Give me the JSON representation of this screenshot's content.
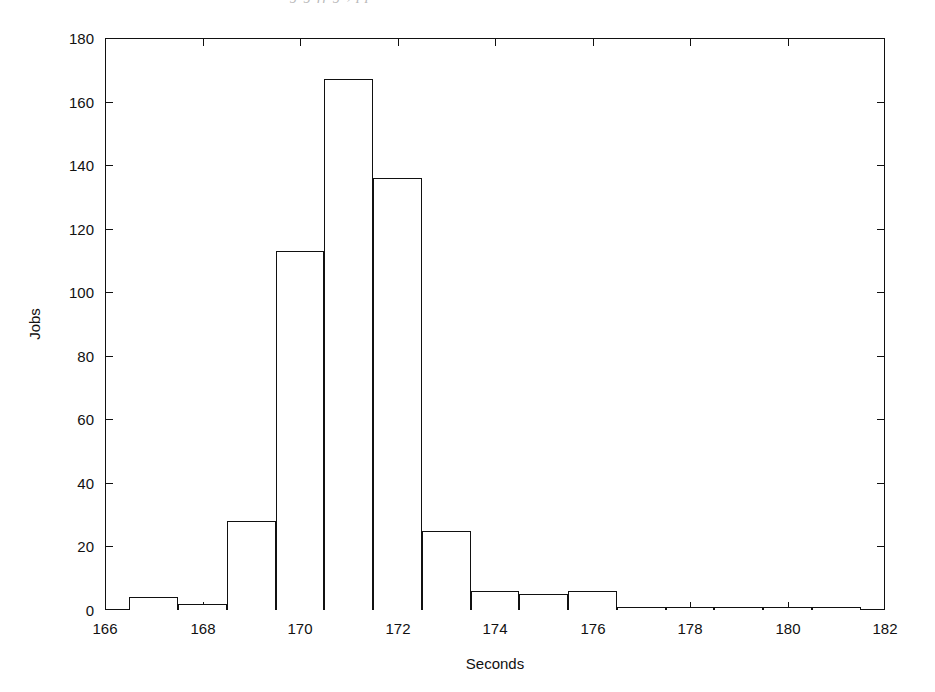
{
  "page": {
    "bleed_text": "g    g            ff  g     ,        pp",
    "background": "#ffffff",
    "ink_color": "#111111"
  },
  "chart_data": {
    "type": "bar",
    "subtype": "histogram",
    "title": "",
    "xlabel": "Seconds",
    "ylabel": "Jobs",
    "xlim": [
      166,
      182
    ],
    "ylim": [
      0,
      180
    ],
    "xticks": [
      166,
      168,
      170,
      172,
      174,
      176,
      178,
      180,
      182
    ],
    "yticks": [
      0,
      20,
      40,
      60,
      80,
      100,
      120,
      140,
      160,
      180
    ],
    "xtick_labels": [
      "166",
      "168",
      "170",
      "172",
      "174",
      "176",
      "178",
      "180",
      "182"
    ],
    "ytick_labels": [
      "0",
      "20",
      "40",
      "60",
      "80",
      "100",
      "120",
      "140",
      "160",
      "180"
    ],
    "grid": false,
    "legend": null,
    "bin_width": 1,
    "bin_edges": [
      166.5,
      167.5,
      168.5,
      169.5,
      170.5,
      171.5,
      172.5,
      173.5,
      174.5,
      175.5,
      176.5,
      177.5,
      178.5,
      179.5,
      180.5,
      181.5
    ],
    "bin_centers": [
      167,
      168,
      169,
      170,
      171,
      172,
      173,
      174,
      175,
      176,
      177,
      178,
      179,
      180,
      181
    ],
    "values": [
      4,
      2,
      28,
      113,
      167,
      136,
      25,
      6,
      5,
      6,
      1,
      1,
      1,
      1,
      1
    ],
    "bar_style": {
      "fill": "#ffffff",
      "stroke": "#111111",
      "stroke_width": 1
    }
  }
}
